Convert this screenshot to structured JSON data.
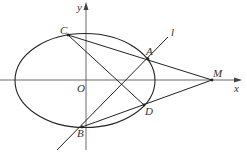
{
  "figure": {
    "axes": {
      "x_label": "x",
      "y_label": "y",
      "origin_label": "O"
    },
    "line_label": "l",
    "points": {
      "A": "A",
      "B": "B",
      "C": "C",
      "D": "D",
      "M": "M"
    }
  }
}
